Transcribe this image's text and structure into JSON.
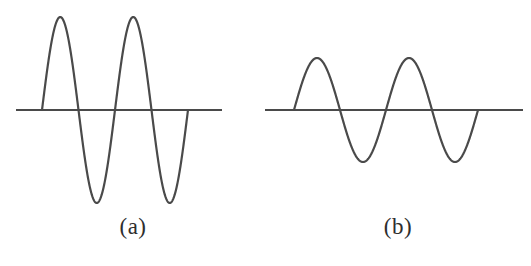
{
  "figure": {
    "background_color": "#ffffff",
    "stroke_color": "#4a4a4a",
    "caption_color": "#2e2e2e"
  },
  "panels": [
    {
      "id": "a",
      "caption": "(a)",
      "axis_label": "horizontal axis line"
    },
    {
      "id": "b",
      "caption": "(b)",
      "axis_label": "horizontal axis line"
    }
  ],
  "chart_data": [
    {
      "type": "line",
      "title": "(a)",
      "xlabel": "",
      "ylabel": "",
      "series": [
        {
          "name": "wave-a",
          "waveform": "sine",
          "amplitude": 93,
          "wavelength": 73,
          "cycles": 2,
          "phase": 0,
          "x_start": 42,
          "x_end": 188,
          "baseline_y": 110,
          "peak_y": 17,
          "trough_y": 203,
          "zero_crossings": [
            42,
            78.5,
            115,
            151.5,
            188
          ]
        }
      ],
      "axis": {
        "x_start": 16,
        "x_end": 222,
        "y": 110,
        "stroke_width": 2
      },
      "grid": false,
      "legend": "none"
    },
    {
      "type": "line",
      "title": "(b)",
      "xlabel": "",
      "ylabel": "",
      "series": [
        {
          "name": "wave-b",
          "waveform": "sine",
          "amplitude": 52,
          "wavelength": 92,
          "cycles": 2,
          "phase": 0,
          "x_start": 294,
          "x_end": 478,
          "baseline_y": 110,
          "peak_y": 58,
          "trough_y": 162,
          "zero_crossings": [
            294,
            340,
            386,
            432,
            478
          ]
        }
      ],
      "axis": {
        "x_start": 262,
        "x_end": 523,
        "y": 110,
        "stroke_width": 2
      },
      "grid": false,
      "legend": "none"
    }
  ]
}
